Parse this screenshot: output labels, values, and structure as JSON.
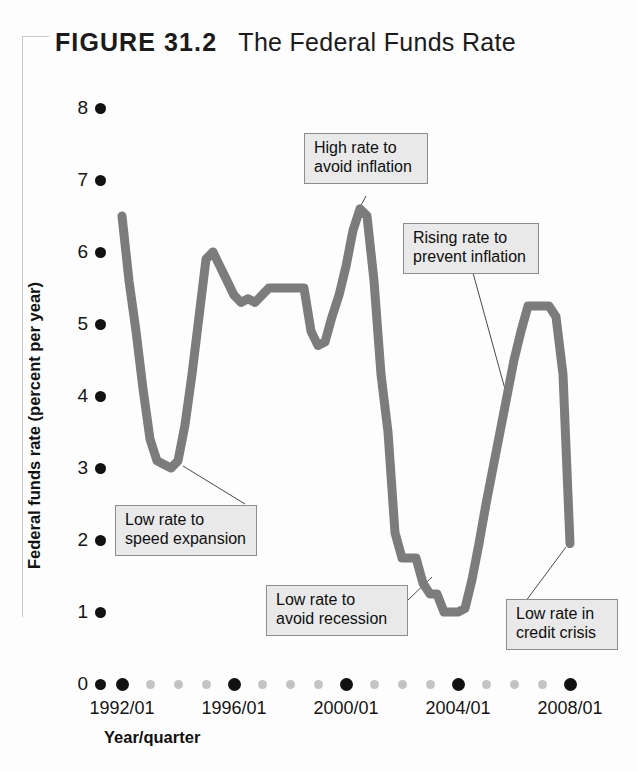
{
  "figure": {
    "label": "FIGURE 31.2",
    "name": "The Federal Funds Rate"
  },
  "axes": {
    "y_title": "Federal funds rate (percent per year)",
    "x_title": "Year/quarter"
  },
  "colors": {
    "line": "#7c7c7c",
    "tick_major": "#111111",
    "tick_minor": "#c3c3c3",
    "callout_fill": "#e9e9e9",
    "callout_border": "#8c8c8c",
    "text": "#141414"
  },
  "annotations": [
    {
      "id": "high-rate-avoid-inflation",
      "text": "High rate to\navoid inflation"
    },
    {
      "id": "rising-rate-prevent-inflation",
      "text": "Rising rate to\nprevent inflation"
    },
    {
      "id": "low-rate-speed-expansion",
      "text": "Low rate to\nspeed expansion"
    },
    {
      "id": "low-rate-avoid-recession",
      "text": "Low rate to\navoid recession"
    },
    {
      "id": "low-rate-credit-crisis",
      "text": "Low rate in\ncredit crisis"
    }
  ],
  "chart_data": {
    "type": "line",
    "title": "The Federal Funds Rate",
    "xlabel": "Year/quarter",
    "ylabel": "Federal funds rate (percent per year)",
    "xlim": [
      "1992/01",
      "2008/01"
    ],
    "ylim": [
      0,
      8
    ],
    "yticks": [
      0,
      1,
      2,
      3,
      4,
      5,
      6,
      7,
      8
    ],
    "xticks": [
      "1992/01",
      "1996/01",
      "2000/01",
      "2004/01",
      "2008/01"
    ],
    "x_minor_ticks_between_majors": 3,
    "grid": false,
    "legend": null,
    "series": [
      {
        "name": "Federal funds rate",
        "x": [
          "1992/01",
          "1992/02",
          "1992/03",
          "1992/04",
          "1993/01",
          "1993/02",
          "1993/03",
          "1993/04",
          "1994/01",
          "1994/02",
          "1994/03",
          "1994/04",
          "1995/01",
          "1995/02",
          "1995/03",
          "1995/04",
          "1996/01",
          "1996/02",
          "1996/03",
          "1996/04",
          "1997/01",
          "1997/02",
          "1997/03",
          "1997/04",
          "1998/01",
          "1998/02",
          "1998/03",
          "1998/04",
          "1999/01",
          "1999/02",
          "1999/03",
          "1999/04",
          "2000/01",
          "2000/02",
          "2000/03",
          "2000/04",
          "2001/01",
          "2001/02",
          "2001/03",
          "2001/04",
          "2002/01",
          "2002/02",
          "2002/03",
          "2002/04",
          "2003/01",
          "2003/02",
          "2003/03",
          "2003/04",
          "2004/01",
          "2004/02",
          "2004/03",
          "2004/04",
          "2005/01",
          "2005/02",
          "2005/03",
          "2005/04",
          "2006/01",
          "2006/02",
          "2006/03",
          "2006/04",
          "2007/01",
          "2007/02",
          "2007/03",
          "2007/04",
          "2008/01"
        ],
        "values": [
          6.5,
          5.6,
          4.9,
          4.1,
          3.4,
          3.1,
          3.05,
          3.0,
          3.1,
          3.6,
          4.3,
          5.1,
          5.9,
          6.0,
          5.8,
          5.6,
          5.4,
          5.3,
          5.35,
          5.3,
          5.4,
          5.5,
          5.5,
          5.5,
          5.5,
          5.5,
          5.5,
          4.9,
          4.7,
          4.75,
          5.1,
          5.4,
          5.8,
          6.3,
          6.6,
          6.5,
          5.6,
          4.3,
          3.5,
          2.1,
          1.75,
          1.75,
          1.75,
          1.4,
          1.25,
          1.25,
          1.0,
          1.0,
          1.0,
          1.05,
          1.45,
          1.95,
          2.5,
          3.0,
          3.5,
          4.0,
          4.5,
          4.9,
          5.25,
          5.25,
          5.25,
          5.25,
          5.1,
          4.3,
          1.95
        ]
      }
    ],
    "annotation_points": [
      {
        "label": "Low rate to speed expansion",
        "x": "1993/03",
        "y": 3.0
      },
      {
        "label": "High rate to avoid inflation",
        "x": "2000/03",
        "y": 6.6
      },
      {
        "label": "Rising rate to prevent inflation",
        "x": "2005/02",
        "y": 3.2
      },
      {
        "label": "Low rate to avoid recession",
        "x": "2002/03",
        "y": 1.75
      },
      {
        "label": "Low rate in credit crisis",
        "x": "2008/01",
        "y": 1.95
      }
    ]
  }
}
